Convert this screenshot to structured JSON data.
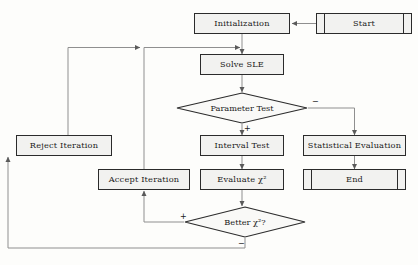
{
  "diagram": {
    "style": {
      "node_fill": "#f2f2f0",
      "node_border": "#2b2b2b",
      "wire_color": "#8a8a8a",
      "arrow_color": "#555555",
      "background": "#fdfdfb"
    },
    "nodes": [
      {
        "id": "start",
        "label": "Start",
        "shape": "terminator",
        "x": 316,
        "y": 13,
        "w": 96,
        "h": 21
      },
      {
        "id": "init",
        "label": "Initialization",
        "shape": "process",
        "x": 194,
        "y": 13,
        "w": 96,
        "h": 21
      },
      {
        "id": "solve",
        "label": "Solve SLE",
        "shape": "process",
        "x": 200,
        "y": 54,
        "w": 84,
        "h": 21
      },
      {
        "id": "paramtest",
        "label": "Parameter Test",
        "shape": "decision",
        "x": 176,
        "y": 92,
        "w": 132,
        "h": 32
      },
      {
        "id": "interval",
        "label": "Interval Test",
        "shape": "process",
        "x": 200,
        "y": 135,
        "w": 84,
        "h": 21
      },
      {
        "id": "stateval",
        "label": "Statistical Evaluation",
        "shape": "process",
        "x": 303,
        "y": 135,
        "w": 103,
        "h": 21
      },
      {
        "id": "reject",
        "label": "Reject Iteration",
        "shape": "process",
        "x": 16,
        "y": 135,
        "w": 96,
        "h": 21
      },
      {
        "id": "evalchi",
        "label": "Evaluate χ²",
        "shape": "process",
        "x": 200,
        "y": 169,
        "w": 84,
        "h": 21
      },
      {
        "id": "end",
        "label": "End",
        "shape": "terminator",
        "x": 303,
        "y": 169,
        "w": 103,
        "h": 21
      },
      {
        "id": "accept",
        "label": "Accept Iteration",
        "shape": "process",
        "x": 98,
        "y": 169,
        "w": 92,
        "h": 21
      },
      {
        "id": "betterchi",
        "label": "Better χ²?",
        "shape": "decision",
        "x": 184,
        "y": 206,
        "w": 122,
        "h": 32
      }
    ],
    "branch_labels": [
      {
        "id": "paramtest-minus",
        "text": "−",
        "x": 312,
        "y": 98
      },
      {
        "id": "paramtest-plus",
        "text": "+",
        "x": 244,
        "y": 125
      },
      {
        "id": "betterchi-plus",
        "text": "+",
        "x": 180,
        "y": 213
      },
      {
        "id": "betterchi-minus",
        "text": "−",
        "x": 238,
        "y": 240
      }
    ],
    "edges": [
      {
        "id": "start-to-init",
        "from": "start",
        "to": "init"
      },
      {
        "id": "init-to-solve",
        "from": "init",
        "to": "solve"
      },
      {
        "id": "solve-to-paramtest",
        "from": "solve",
        "to": "paramtest"
      },
      {
        "id": "paramtest-plus-interval",
        "from": "paramtest",
        "to": "interval",
        "label": "+"
      },
      {
        "id": "paramtest-minus-stateval",
        "from": "paramtest",
        "to": "stateval",
        "label": "−"
      },
      {
        "id": "interval-to-evalchi",
        "from": "interval",
        "to": "evalchi"
      },
      {
        "id": "stateval-to-end",
        "from": "stateval",
        "to": "end"
      },
      {
        "id": "evalchi-to-betterchi",
        "from": "evalchi",
        "to": "betterchi"
      },
      {
        "id": "betterchi-plus-accept",
        "from": "betterchi",
        "to": "accept",
        "label": "+"
      },
      {
        "id": "betterchi-minus-reject",
        "from": "betterchi",
        "to": "reject",
        "label": "−"
      },
      {
        "id": "accept-to-solve-loop",
        "from": "accept",
        "to": "solve"
      },
      {
        "id": "reject-to-solve-loop",
        "from": "reject",
        "to": "solve"
      }
    ]
  }
}
